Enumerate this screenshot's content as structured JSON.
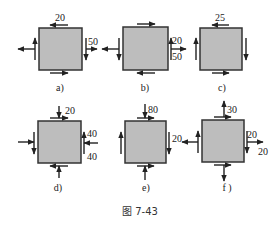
{
  "figure": {
    "caption": "图 7-43",
    "square_fill": "#bdbdbd",
    "square_stroke": "#333333",
    "arrow_color": "#222222"
  },
  "panels": [
    {
      "id": "a",
      "label": "a)",
      "box": [
        39,
        28,
        43,
        42
      ],
      "values": [
        {
          "text": "20",
          "x": 55,
          "y": 21
        },
        {
          "text": "50",
          "x": 88,
          "y": 45
        }
      ],
      "arrows": [
        {
          "x1": 68,
          "y1": 25,
          "x2": 50,
          "y2": 25
        },
        {
          "x1": 50,
          "y1": 73,
          "x2": 68,
          "y2": 73
        },
        {
          "x1": 35,
          "y1": 60,
          "x2": 35,
          "y2": 38
        },
        {
          "x1": 86,
          "y1": 38,
          "x2": 86,
          "y2": 60
        },
        {
          "x1": 35,
          "y1": 49,
          "x2": 18,
          "y2": 49
        },
        {
          "x1": 86,
          "y1": 49,
          "x2": 97,
          "y2": 49
        }
      ]
    },
    {
      "id": "b",
      "label": "b)",
      "box": [
        123,
        27,
        45,
        43
      ],
      "values": [
        {
          "text": "20",
          "x": 172,
          "y": 44
        },
        {
          "text": "50",
          "x": 172,
          "y": 60
        }
      ],
      "arrows": [
        {
          "x1": 137,
          "y1": 24,
          "x2": 155,
          "y2": 24
        },
        {
          "x1": 155,
          "y1": 73,
          "x2": 137,
          "y2": 73
        },
        {
          "x1": 119,
          "y1": 38,
          "x2": 119,
          "y2": 60
        },
        {
          "x1": 171,
          "y1": 60,
          "x2": 171,
          "y2": 38
        },
        {
          "x1": 119,
          "y1": 49,
          "x2": 102,
          "y2": 49
        },
        {
          "x1": 171,
          "y1": 49,
          "x2": 186,
          "y2": 49
        }
      ]
    },
    {
      "id": "c",
      "label": "c)",
      "box": [
        200,
        28,
        42,
        42
      ],
      "values": [
        {
          "text": "25",
          "x": 215,
          "y": 21
        }
      ],
      "arrows": [
        {
          "x1": 229,
          "y1": 25,
          "x2": 212,
          "y2": 25
        },
        {
          "x1": 212,
          "y1": 73,
          "x2": 229,
          "y2": 73
        },
        {
          "x1": 196,
          "y1": 60,
          "x2": 196,
          "y2": 38
        },
        {
          "x1": 246,
          "y1": 38,
          "x2": 246,
          "y2": 60
        }
      ]
    },
    {
      "id": "d",
      "label": "d)",
      "box": [
        38,
        121,
        43,
        42
      ],
      "values": [
        {
          "text": "20",
          "x": 65,
          "y": 114
        },
        {
          "text": "40",
          "x": 87,
          "y": 137
        },
        {
          "text": "40",
          "x": 87,
          "y": 160
        }
      ],
      "arrows": [
        {
          "x1": 50,
          "y1": 118,
          "x2": 68,
          "y2": 118
        },
        {
          "x1": 68,
          "y1": 166,
          "x2": 50,
          "y2": 166
        },
        {
          "x1": 34,
          "y1": 132,
          "x2": 34,
          "y2": 154
        },
        {
          "x1": 84,
          "y1": 154,
          "x2": 84,
          "y2": 132
        },
        {
          "x1": 59,
          "y1": 106,
          "x2": 59,
          "y2": 118
        },
        {
          "x1": 59,
          "y1": 178,
          "x2": 59,
          "y2": 166
        },
        {
          "x1": 18,
          "y1": 142,
          "x2": 34,
          "y2": 142
        },
        {
          "x1": 98,
          "y1": 143,
          "x2": 84,
          "y2": 143
        }
      ]
    },
    {
      "id": "e",
      "label": "e)",
      "box": [
        125,
        121,
        41,
        42
      ],
      "values": [
        {
          "text": "80",
          "x": 148,
          "y": 113
        },
        {
          "text": "20",
          "x": 172,
          "y": 142
        }
      ],
      "arrows": [
        {
          "x1": 137,
          "y1": 118,
          "x2": 154,
          "y2": 118
        },
        {
          "x1": 137,
          "y1": 166,
          "x2": 154,
          "y2": 166
        },
        {
          "x1": 121,
          "y1": 154,
          "x2": 121,
          "y2": 132
        },
        {
          "x1": 169,
          "y1": 132,
          "x2": 169,
          "y2": 154
        },
        {
          "x1": 145,
          "y1": 104,
          "x2": 145,
          "y2": 118
        },
        {
          "x1": 145,
          "y1": 180,
          "x2": 145,
          "y2": 166
        }
      ]
    },
    {
      "id": "f",
      "label": "f )",
      "box": [
        202,
        120,
        42,
        42
      ],
      "values": [
        {
          "text": "30",
          "x": 227,
          "y": 113
        },
        {
          "text": "20",
          "x": 247,
          "y": 138
        },
        {
          "text": "20",
          "x": 258,
          "y": 155
        }
      ],
      "arrows": [
        {
          "x1": 214,
          "y1": 117,
          "x2": 231,
          "y2": 117
        },
        {
          "x1": 214,
          "y1": 165,
          "x2": 231,
          "y2": 165
        },
        {
          "x1": 198,
          "y1": 153,
          "x2": 198,
          "y2": 131
        },
        {
          "x1": 247,
          "y1": 131,
          "x2": 247,
          "y2": 153
        },
        {
          "x1": 224,
          "y1": 117,
          "x2": 224,
          "y2": 101
        },
        {
          "x1": 224,
          "y1": 165,
          "x2": 224,
          "y2": 181
        },
        {
          "x1": 198,
          "y1": 142,
          "x2": 182,
          "y2": 142
        },
        {
          "x1": 247,
          "y1": 142,
          "x2": 263,
          "y2": 142
        }
      ]
    }
  ],
  "label_positions": {
    "a": [
      60,
      91
    ],
    "b": [
      145,
      91
    ],
    "c": [
      222,
      91
    ],
    "d": [
      58,
      191
    ],
    "e": [
      146,
      191
    ],
    "f": [
      227,
      191
    ]
  }
}
